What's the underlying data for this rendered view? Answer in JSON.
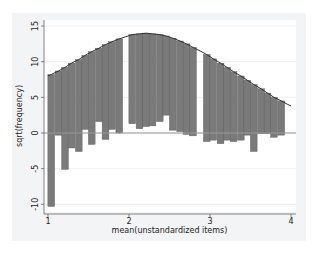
{
  "chart_data": {
    "type": "bar",
    "subtype": "hanging rootogram",
    "title": "",
    "xlabel": "mean(unstandardized items)",
    "ylabel": "sqrt(frequency)",
    "xlim": [
      1,
      4
    ],
    "ylim": [
      -10.5,
      15
    ],
    "xticks": [
      1,
      2,
      3,
      4
    ],
    "yticks": [
      -10,
      -5,
      0,
      5,
      10,
      15
    ],
    "grid": true,
    "legend": null,
    "bin_width": 0.0833,
    "bins": [
      {
        "x": 1.04,
        "top": 8.2,
        "bottom": -10.3
      },
      {
        "x": 1.13,
        "top": 8.7,
        "bottom": -0.3
      },
      {
        "x": 1.21,
        "top": 9.2,
        "bottom": -5.1
      },
      {
        "x": 1.29,
        "top": 9.8,
        "bottom": -2.1
      },
      {
        "x": 1.38,
        "top": 10.3,
        "bottom": -2.6
      },
      {
        "x": 1.46,
        "top": 10.9,
        "bottom": 0.5
      },
      {
        "x": 1.54,
        "top": 11.4,
        "bottom": -1.6
      },
      {
        "x": 1.63,
        "top": 11.9,
        "bottom": 1.6
      },
      {
        "x": 1.71,
        "top": 12.4,
        "bottom": -0.9
      },
      {
        "x": 1.79,
        "top": 12.8,
        "bottom": 0.5
      },
      {
        "x": 1.88,
        "top": 13.2,
        "bottom": 0.0
      },
      {
        "x": 1.96,
        "top": 13.5,
        "bottom": 13.5
      },
      {
        "x": 2.04,
        "top": 13.8,
        "bottom": 1.3
      },
      {
        "x": 2.13,
        "top": 13.9,
        "bottom": 0.6
      },
      {
        "x": 2.21,
        "top": 14.0,
        "bottom": 0.9
      },
      {
        "x": 2.29,
        "top": 13.9,
        "bottom": 1.0
      },
      {
        "x": 2.38,
        "top": 13.8,
        "bottom": 1.6
      },
      {
        "x": 2.46,
        "top": 13.6,
        "bottom": 2.5
      },
      {
        "x": 2.54,
        "top": 13.3,
        "bottom": 0.4
      },
      {
        "x": 2.63,
        "top": 12.9,
        "bottom": 0.2
      },
      {
        "x": 2.71,
        "top": 12.5,
        "bottom": -0.2
      },
      {
        "x": 2.79,
        "top": 12.0,
        "bottom": -0.4
      },
      {
        "x": 2.88,
        "top": 11.5,
        "bottom": 11.5
      },
      {
        "x": 2.96,
        "top": 11.0,
        "bottom": -1.2
      },
      {
        "x": 3.04,
        "top": 10.4,
        "bottom": -1.0
      },
      {
        "x": 3.13,
        "top": 9.8,
        "bottom": -1.5
      },
      {
        "x": 3.21,
        "top": 9.2,
        "bottom": -1.0
      },
      {
        "x": 3.29,
        "top": 8.6,
        "bottom": -1.2
      },
      {
        "x": 3.38,
        "top": 8.0,
        "bottom": -1.0
      },
      {
        "x": 3.46,
        "top": 7.4,
        "bottom": -0.3
      },
      {
        "x": 3.54,
        "top": 6.8,
        "bottom": -2.6
      },
      {
        "x": 3.63,
        "top": 6.2,
        "bottom": -0.1
      },
      {
        "x": 3.71,
        "top": 5.6,
        "bottom": -0.1
      },
      {
        "x": 3.79,
        "top": 5.0,
        "bottom": -0.6
      },
      {
        "x": 3.88,
        "top": 4.5,
        "bottom": -0.3
      },
      {
        "x": 3.96,
        "top": 4.0,
        "bottom": 4.0
      }
    ],
    "curve": "normal density (sqrt expected frequency)",
    "colors": {
      "bar": "#7a7a7a",
      "bar_edge": "#5a5a5a",
      "curve": "#333333",
      "zero_line": "#999999",
      "grid": "#e6e6e6",
      "plot_bg": "#ffffff",
      "outer_bg": "#f3f4f5"
    }
  }
}
